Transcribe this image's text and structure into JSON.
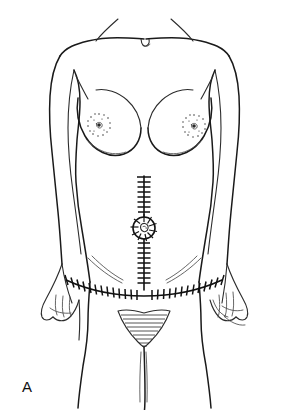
{
  "figure": {
    "panel_label": "A",
    "caption_text": "",
    "background_color": "#ffffff",
    "ink_color": "#1a1a1a",
    "width": 289,
    "height": 410,
    "style": "black-and-white pen line drawing"
  },
  "anatomy": {
    "regions": [
      {
        "name": "shoulders",
        "label": "shoulders"
      },
      {
        "name": "suprasternal-notch",
        "label": "suprasternal notch"
      },
      {
        "name": "left-breast",
        "label": "left breast"
      },
      {
        "name": "right-breast",
        "label": "right breast"
      },
      {
        "name": "left-nipple",
        "label": "left nipple and areola"
      },
      {
        "name": "right-nipple",
        "label": "right nipple and areola"
      },
      {
        "name": "abdomen",
        "label": "abdomen"
      },
      {
        "name": "umbilicus",
        "label": "umbilicus"
      },
      {
        "name": "left-arm",
        "label": "left arm"
      },
      {
        "name": "right-arm",
        "label": "right arm"
      },
      {
        "name": "left-hand",
        "label": "left hand"
      },
      {
        "name": "right-hand",
        "label": "right hand"
      },
      {
        "name": "inguinal-creases",
        "label": "inguinal creases"
      },
      {
        "name": "pubic-region",
        "label": "pubic region"
      },
      {
        "name": "thighs",
        "label": "thighs"
      }
    ]
  },
  "incisions": [
    {
      "id": "vertical-midline",
      "label": "vertical midline laparotomy incision",
      "orientation": "vertical",
      "closure": "staples",
      "encircles_umbilicus": true,
      "upper_segment_staples": 8,
      "lower_segment_staples": 9,
      "periumbilical_staples": 10
    },
    {
      "id": "transverse-lower",
      "label": "transverse lower abdominal (Pfannenstiel-type) incision",
      "orientation": "transverse",
      "closure": "staples",
      "left_segment_staples": 13,
      "right_segment_staples": 13
    }
  ],
  "geometry": {
    "vertical_incision": {
      "x": 144,
      "top_y": 176,
      "bottom_y": 290,
      "umbilicus_center_y": 228,
      "umbilicus_radius": 11
    },
    "transverse_incision": {
      "center_x": 144,
      "center_y": 289,
      "left_end_x": 66,
      "right_end_x": 222,
      "arc_rise": 9
    },
    "nipples": {
      "left": {
        "cx": 99,
        "cy": 125,
        "areola_r": 11
      },
      "right": {
        "cx": 194,
        "cy": 126,
        "areola_r": 11
      }
    },
    "pubic_triangle": {
      "apex_x": 144,
      "apex_y": 347,
      "left_x": 118,
      "right_x": 170,
      "top_y": 311,
      "hatch_lines": 9
    },
    "panel_label_pos": {
      "x": 22,
      "y": 392
    }
  }
}
